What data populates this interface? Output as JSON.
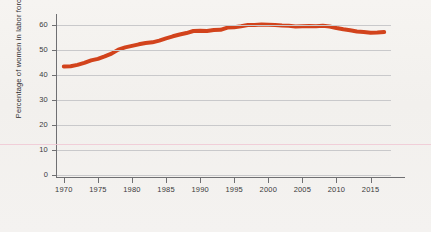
{
  "chart_data": {
    "type": "line",
    "title": "",
    "subtitle": "",
    "xlabel": "",
    "ylabel": "Percentage of women in labor force",
    "xlim": [
      1969,
      2018
    ],
    "ylim": [
      0,
      63
    ],
    "grid": true,
    "legend_position": "none",
    "line_color": "#d2431c",
    "background_color": "#f4f2ef",
    "gridline_color": "#c9c9cb",
    "axis_color": "#6f6f72",
    "artifact_line_color": "#f0c8d4",
    "y_ticks": [
      0,
      10,
      20,
      30,
      40,
      50,
      60
    ],
    "y_tick_labels": [
      "0",
      "10",
      "20",
      "30",
      "40",
      "50",
      "60"
    ],
    "x_ticks": [
      1970,
      1975,
      1980,
      1985,
      1990,
      1995,
      2000,
      2005,
      2010,
      2015
    ],
    "x_tick_labels": [
      "1970",
      "1975",
      "1980",
      "1985",
      "1990",
      "1995",
      "2000",
      "2005",
      "2010",
      "2015"
    ],
    "series": [
      {
        "name": "Percentage of women in labor force",
        "x": [
          1970,
          1971,
          1972,
          1973,
          1974,
          1975,
          1976,
          1977,
          1978,
          1979,
          1980,
          1981,
          1982,
          1983,
          1984,
          1985,
          1986,
          1987,
          1988,
          1989,
          1990,
          1991,
          1992,
          1993,
          1994,
          1995,
          1996,
          1997,
          1998,
          1999,
          2000,
          2001,
          2002,
          2003,
          2004,
          2005,
          2006,
          2007,
          2008,
          2009,
          2010,
          2011,
          2012,
          2013,
          2014,
          2015,
          2016,
          2017
        ],
        "values": [
          43.3,
          43.4,
          43.9,
          44.7,
          45.7,
          46.3,
          47.3,
          48.4,
          50.0,
          50.9,
          51.5,
          52.1,
          52.6,
          52.9,
          53.6,
          54.5,
          55.3,
          56.0,
          56.6,
          57.4,
          57.5,
          57.4,
          57.8,
          57.9,
          58.8,
          58.9,
          59.3,
          59.8,
          59.8,
          60.0,
          59.9,
          59.8,
          59.6,
          59.5,
          59.2,
          59.3,
          59.4,
          59.3,
          59.5,
          59.2,
          58.6,
          58.1,
          57.7,
          57.2,
          57.0,
          56.7,
          56.8,
          57.0
        ]
      }
    ]
  }
}
